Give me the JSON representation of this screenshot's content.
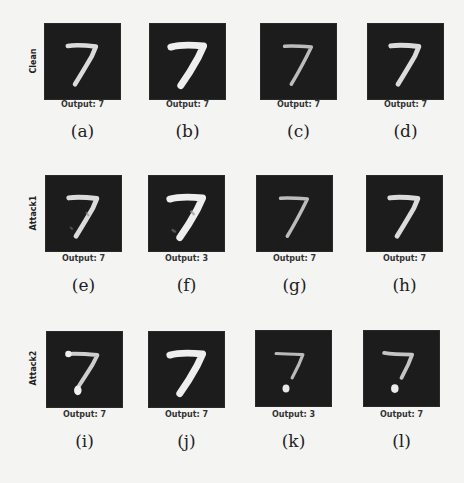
{
  "figure": {
    "rows": [
      {
        "label": "Clean",
        "cells": [
          {
            "output": "Output: 7",
            "caption": "(a)",
            "variant": "clean-thin"
          },
          {
            "output": "Output: 7",
            "caption": "(b)",
            "variant": "clean-thick"
          },
          {
            "output": "Output: 7",
            "caption": "(c)",
            "variant": "clean-faint"
          },
          {
            "output": "Output: 7",
            "caption": "(d)",
            "variant": "clean-thin"
          }
        ]
      },
      {
        "label": "Attack1",
        "cells": [
          {
            "output": "Output: 7",
            "caption": "(e)",
            "variant": "attack1-thin"
          },
          {
            "output": "Output: 3",
            "caption": "(f)",
            "variant": "attack1-thick"
          },
          {
            "output": "Output: 7",
            "caption": "(g)",
            "variant": "clean-faint"
          },
          {
            "output": "Output: 7",
            "caption": "(h)",
            "variant": "clean-thin"
          }
        ]
      },
      {
        "label": "Attack2",
        "cells": [
          {
            "output": "Output: 7",
            "caption": "(i)",
            "variant": "attack2-dot"
          },
          {
            "output": "Output: 7",
            "caption": "(j)",
            "variant": "clean-thick"
          },
          {
            "output": "Output: 3",
            "caption": "(k)",
            "variant": "attack2-broken"
          },
          {
            "output": "Output: 7",
            "caption": "(l)",
            "variant": "attack2-broken"
          }
        ]
      }
    ]
  },
  "colors": {
    "page_background": "#f4f4f3",
    "image_background": "#1c1c1c",
    "digit_stroke": "#e8e8e8"
  }
}
